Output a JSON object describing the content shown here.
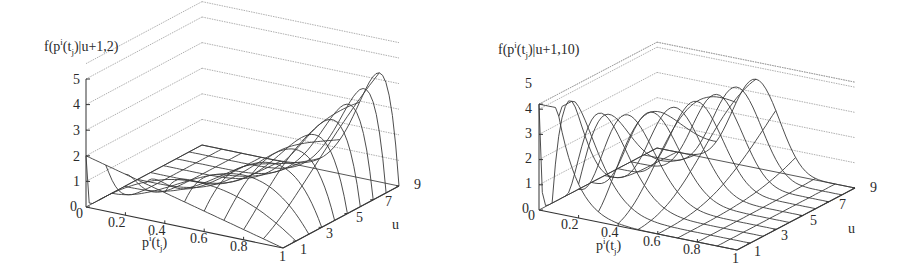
{
  "figure": {
    "panels": [
      {
        "id": "left",
        "zlabel_prefix": "f(p",
        "zlabel_sup": "i",
        "zlabel_mid": "(t",
        "zlabel_sub": "j",
        "zlabel_suffix": ")|u+1,2)",
        "xlabel_prefix": "p",
        "xlabel_sup": "i",
        "xlabel_mid": "(t",
        "xlabel_sub": "j",
        "xlabel_suffix": ")",
        "ulabel": "u",
        "z_ticks": [
          "0",
          "1",
          "2",
          "3",
          "4",
          "5"
        ],
        "p_ticks": [
          "0",
          "0.2",
          "0.4",
          "0.6",
          "0.8",
          "1"
        ],
        "u_ticks": [
          "1",
          "3",
          "5",
          "7",
          "9"
        ]
      },
      {
        "id": "right",
        "zlabel_prefix": "f(p",
        "zlabel_sup": "i",
        "zlabel_mid": "(t",
        "zlabel_sub": "j",
        "zlabel_suffix": ")|u+1,10)",
        "xlabel_prefix": "p",
        "xlabel_sup": "i",
        "xlabel_mid": "(t",
        "xlabel_sub": "j",
        "xlabel_suffix": ")",
        "ulabel": "u",
        "z_ticks": [
          "0",
          "1",
          "2",
          "3",
          "4",
          "5"
        ],
        "p_ticks": [
          "0",
          "0.2",
          "0.4",
          "0.6",
          "0.8",
          "1"
        ],
        "u_ticks": [
          "1",
          "3",
          "5",
          "7",
          "9"
        ]
      }
    ]
  },
  "chart_data": [
    {
      "type": "surface",
      "title": "",
      "zlabel": "f(p^i(t_j)|u+1,2)",
      "xlabel": "p^i(t_j)",
      "ylabel": "u",
      "x_range": [
        0,
        1
      ],
      "y_range": [
        0,
        9
      ],
      "z_range": [
        0,
        5
      ],
      "x_ticks": [
        0,
        0.2,
        0.4,
        0.6,
        0.8,
        1
      ],
      "y_ticks": [
        1,
        3,
        5,
        7,
        9
      ],
      "z_ticks": [
        0,
        1,
        2,
        3,
        4,
        5
      ],
      "function": "Beta density with alpha = u+1, beta = 2",
      "alpha_offset": 1,
      "beta": 2,
      "u_values": [
        0,
        1,
        2,
        3,
        4,
        5,
        6,
        7,
        8,
        9
      ],
      "p_grid_steps": 10,
      "peak_values_by_u": [
        2.0,
        1.78,
        2.11,
        2.46,
        2.82,
        3.19,
        3.57,
        3.94,
        4.32,
        4.7
      ],
      "grid": true,
      "wireframe": true
    },
    {
      "type": "surface",
      "title": "",
      "zlabel": "f(p^i(t_j)|u+1,10)",
      "xlabel": "p^i(t_j)",
      "ylabel": "u",
      "x_range": [
        0,
        1
      ],
      "y_range": [
        0,
        9
      ],
      "z_range": [
        0,
        5
      ],
      "x_ticks": [
        0,
        0.2,
        0.4,
        0.6,
        0.8,
        1
      ],
      "y_ticks": [
        1,
        3,
        5,
        7,
        9
      ],
      "z_ticks": [
        0,
        1,
        2,
        3,
        4,
        5
      ],
      "function": "Beta density with alpha = u+1, beta = 10",
      "alpha_offset": 1,
      "beta": 10,
      "u_values": [
        0,
        1,
        2,
        3,
        4,
        5,
        6,
        7,
        8,
        9
      ],
      "p_grid_steps": 10,
      "peak_values_by_u": [
        10.0,
        4.26,
        3.4,
        3.09,
        2.96,
        2.9,
        2.88,
        2.89,
        2.91,
        2.95
      ],
      "grid": true,
      "wireframe": true
    }
  ]
}
